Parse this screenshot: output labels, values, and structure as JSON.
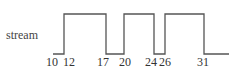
{
  "diagram": {
    "signal_name": "stream",
    "line_color": "#555555",
    "levels": {
      "high_y": 14,
      "low_y": 54
    },
    "segments": [
      {
        "from": 10,
        "to": 12,
        "level": "low"
      },
      {
        "from": 12,
        "to": 17,
        "level": "high"
      },
      {
        "from": 17,
        "to": 20,
        "level": "low"
      },
      {
        "from": 20,
        "to": 24,
        "level": "high"
      },
      {
        "from": 24,
        "to": 26,
        "level": "low"
      },
      {
        "from": 26,
        "to": 31,
        "level": "high"
      },
      {
        "from": 31,
        "to": null,
        "level": "low"
      }
    ],
    "ticks": [
      {
        "label": "10",
        "x": 52
      },
      {
        "label": "12",
        "x": 69
      },
      {
        "label": "17",
        "x": 103
      },
      {
        "label": "20",
        "x": 125
      },
      {
        "label": "24",
        "x": 152
      },
      {
        "label": "26",
        "x": 164
      },
      {
        "label": "31",
        "x": 203
      }
    ]
  }
}
